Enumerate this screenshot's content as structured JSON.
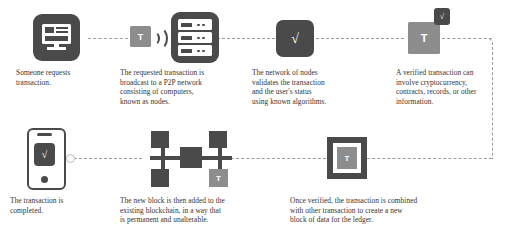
{
  "diagram": {
    "colors": {
      "dark": "#4a4a4a",
      "mid": "#8d8d8d",
      "line": "#9a9a9a",
      "background": "#ffffff",
      "text": "#333333"
    },
    "steps": [
      {
        "id": "step-1",
        "icon": "monitor-icon",
        "caption": "Someone requests\ntransaction."
      },
      {
        "id": "step-2",
        "icon": "broadcast-icon",
        "tile_label": "T",
        "caption": "The requested transaction is\nbroadcast to a P2P network\nconsisting of computers,\nknown as nodes."
      },
      {
        "id": "step-3",
        "icon": "server-nodes-icon",
        "caption": ""
      },
      {
        "id": "step-4",
        "icon": "verified-check-icon",
        "check_label": "√",
        "caption": "The network of nodes\nvalidates the transaction\nand the user's status\nusing known algorithms."
      },
      {
        "id": "step-5",
        "icon": "verified-transaction-icon",
        "tile_label": "T",
        "badge_label": "√",
        "caption": "A verified transaction can\ninvolve cryptocurrency,\ncontracts, records, or other\ninformation."
      },
      {
        "id": "step-6",
        "icon": "ledger-block-icon",
        "tile_label": "T",
        "caption": "Once verified, the transaction is combined\nwith other transaction to create a new\nblock of data for the ledger."
      },
      {
        "id": "step-7",
        "icon": "blockchain-network-icon",
        "tile_label": "T",
        "caption": "The new block is then added to the\nexisting blockchain, in a way that\nis permanent and unalterable."
      },
      {
        "id": "step-8",
        "icon": "smartphone-complete-icon",
        "check_label": "√",
        "caption": "The transaction is\ncompleted."
      }
    ],
    "labels": {
      "t_tile": "T",
      "checkmark": "√"
    }
  }
}
